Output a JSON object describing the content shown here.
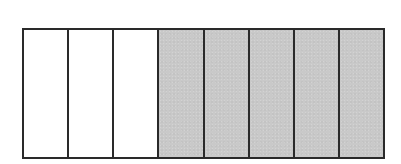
{
  "diagram": {
    "type": "fraction-bar",
    "total_parts": 8,
    "shaded_parts": 5,
    "unshaded_parts": 3,
    "segments": [
      {
        "index": 1,
        "shaded": false
      },
      {
        "index": 2,
        "shaded": false
      },
      {
        "index": 3,
        "shaded": false
      },
      {
        "index": 4,
        "shaded": true
      },
      {
        "index": 5,
        "shaded": true
      },
      {
        "index": 6,
        "shaded": true
      },
      {
        "index": 7,
        "shaded": true
      },
      {
        "index": 8,
        "shaded": true
      }
    ],
    "colors": {
      "shaded": "#c9c9c9",
      "unshaded": "#ffffff",
      "border": "#2a2a2a"
    }
  }
}
